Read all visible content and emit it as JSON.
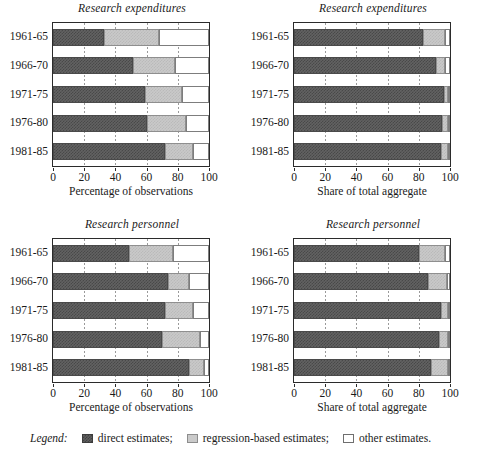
{
  "legend": {
    "word": "Legend:",
    "entries": [
      {
        "key": "direct",
        "label": "direct estimates;"
      },
      {
        "key": "regression",
        "label": "regression-based estimates;"
      },
      {
        "key": "other",
        "label": "other estimates."
      }
    ],
    "colors": {
      "direct": "#5e5e5e",
      "regression": "#cacaca",
      "other": "#ffffff"
    }
  },
  "axis": {
    "ticks": [
      0,
      20,
      40,
      60,
      80,
      100
    ],
    "tick_labels": [
      "0",
      "20",
      "40",
      "60",
      "80",
      "100"
    ],
    "gridlines": [
      20,
      40,
      60,
      80
    ],
    "xlim": [
      0,
      100
    ]
  },
  "categories": [
    "1961-65",
    "1966-70",
    "1971-75",
    "1976-80",
    "1981-85"
  ],
  "chart_data": [
    {
      "id": "expenditures-observations",
      "type": "bar",
      "orientation": "horizontal",
      "stacked": true,
      "title": "Research expenditures",
      "xlabel": "Percentage of observations",
      "ylabel": "",
      "xlim": [
        0,
        100
      ],
      "grid": true,
      "legend_position": "figure-bottom",
      "categories": [
        "1961-65",
        "1966-70",
        "1971-75",
        "1976-80",
        "1981-85"
      ],
      "series": [
        {
          "name": "direct estimates",
          "values": [
            33,
            51,
            59,
            60,
            72
          ]
        },
        {
          "name": "regression-based estimates",
          "values": [
            35,
            27,
            24,
            25,
            18
          ]
        },
        {
          "name": "other estimates",
          "values": [
            32,
            22,
            17,
            15,
            10
          ]
        }
      ],
      "cumulative_boundaries": [
        [
          33,
          68
        ],
        [
          51,
          78
        ],
        [
          59,
          83
        ],
        [
          60,
          85
        ],
        [
          72,
          90
        ]
      ]
    },
    {
      "id": "expenditures-aggregate",
      "type": "bar",
      "orientation": "horizontal",
      "stacked": true,
      "title": "Research expenditures",
      "xlabel": "Share of total aggregate",
      "ylabel": "",
      "xlim": [
        0,
        100
      ],
      "grid": true,
      "legend_position": "figure-bottom",
      "categories": [
        "1961-65",
        "1966-70",
        "1971-75",
        "1976-80",
        "1981-85"
      ],
      "series": [
        {
          "name": "direct estimates",
          "values": [
            83,
            91,
            96,
            95,
            94
          ]
        },
        {
          "name": "regression-based estimates",
          "values": [
            14,
            6,
            3,
            4,
            5
          ]
        },
        {
          "name": "other estimates",
          "values": [
            3,
            3,
            1,
            1,
            1
          ]
        }
      ],
      "cumulative_boundaries": [
        [
          83,
          97
        ],
        [
          91,
          97
        ],
        [
          96,
          99
        ],
        [
          95,
          99
        ],
        [
          94,
          99
        ]
      ]
    },
    {
      "id": "personnel-observations",
      "type": "bar",
      "orientation": "horizontal",
      "stacked": true,
      "title": "Research personnel",
      "xlabel": "Percentage of observations",
      "ylabel": "",
      "xlim": [
        0,
        100
      ],
      "grid": true,
      "legend_position": "figure-bottom",
      "categories": [
        "1961-65",
        "1966-70",
        "1971-75",
        "1976-80",
        "1981-85"
      ],
      "series": [
        {
          "name": "direct estimates",
          "values": [
            49,
            74,
            72,
            70,
            87
          ]
        },
        {
          "name": "regression-based estimates",
          "values": [
            28,
            13,
            18,
            24,
            10
          ]
        },
        {
          "name": "other estimates",
          "values": [
            23,
            13,
            10,
            6,
            3
          ]
        }
      ],
      "cumulative_boundaries": [
        [
          49,
          77
        ],
        [
          74,
          87
        ],
        [
          72,
          90
        ],
        [
          70,
          94
        ],
        [
          87,
          97
        ]
      ]
    },
    {
      "id": "personnel-aggregate",
      "type": "bar",
      "orientation": "horizontal",
      "stacked": true,
      "title": "Research personnel",
      "xlabel": "Share of total aggregate",
      "ylabel": "",
      "xlim": [
        0,
        100
      ],
      "grid": true,
      "legend_position": "figure-bottom",
      "categories": [
        "1961-65",
        "1966-70",
        "1971-75",
        "1976-80",
        "1981-85"
      ],
      "series": [
        {
          "name": "direct estimates",
          "values": [
            80,
            86,
            94,
            93,
            88
          ]
        },
        {
          "name": "regression-based estimates",
          "values": [
            17,
            12,
            5,
            6,
            11
          ]
        },
        {
          "name": "other estimates",
          "values": [
            3,
            2,
            1,
            1,
            1
          ]
        }
      ],
      "cumulative_boundaries": [
        [
          80,
          97
        ],
        [
          86,
          98
        ],
        [
          94,
          99
        ],
        [
          93,
          99
        ],
        [
          88,
          99
        ]
      ]
    }
  ]
}
